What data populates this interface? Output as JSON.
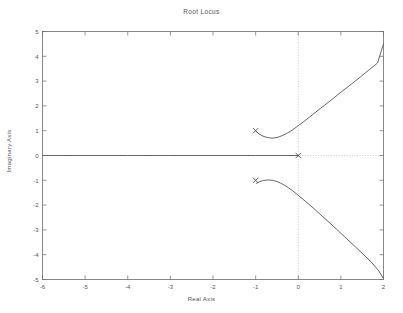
{
  "figure": {
    "title": "Root Locus",
    "background": "#ffffff",
    "axis_color": "#6b6b6b",
    "line_color": "#4a4a4a",
    "grid_color": "#b9b9b9"
  },
  "chart_data": {
    "type": "line",
    "title": "Root Locus",
    "xlabel": "Real Axis",
    "ylabel": "Imaginary Axis",
    "xlim": [
      -6,
      2
    ],
    "ylim": [
      -5,
      5
    ],
    "xticks": [
      -6,
      -5,
      -4,
      -3,
      -2,
      -1,
      0,
      1,
      2
    ],
    "xticklabels": [
      "-6",
      "-5",
      "-4",
      "-3",
      "-2",
      "-1",
      "0",
      "1",
      "2"
    ],
    "yticks": [
      -5,
      -4,
      -3,
      -2,
      -1,
      0,
      1,
      2,
      3,
      4,
      5
    ],
    "yticklabels": [
      "-5",
      "-4",
      "-3",
      "-2",
      "-1",
      "0",
      "1",
      "2",
      "3",
      "4",
      "5"
    ],
    "grid": false,
    "legend": null,
    "zero_lines": {
      "vertical_x": 0,
      "horizontal_y": 0,
      "style": "dotted"
    },
    "markers": [
      {
        "name": "open-loop-pole",
        "symbol": "x",
        "x": -1.0,
        "y": 1.0
      },
      {
        "name": "open-loop-pole",
        "symbol": "x",
        "x": -1.0,
        "y": -1.0
      },
      {
        "name": "open-loop-pole",
        "symbol": "x",
        "x": 0.0,
        "y": 0.0
      }
    ],
    "series": [
      {
        "name": "real-axis-branch",
        "points": [
          [
            -6.0,
            0.0
          ],
          [
            -5.0,
            0.0
          ],
          [
            -4.0,
            0.0
          ],
          [
            -3.0,
            0.0
          ],
          [
            -2.0,
            0.0
          ],
          [
            -1.0,
            0.0
          ],
          [
            -0.5,
            0.0
          ],
          [
            0.0,
            0.0
          ]
        ]
      },
      {
        "name": "upper-complex-branch",
        "points": [
          [
            -0.98,
            0.96
          ],
          [
            -0.92,
            0.87
          ],
          [
            -0.85,
            0.8
          ],
          [
            -0.78,
            0.75
          ],
          [
            -0.7,
            0.72
          ],
          [
            -0.62,
            0.7
          ],
          [
            -0.55,
            0.71
          ],
          [
            -0.47,
            0.74
          ],
          [
            -0.38,
            0.8
          ],
          [
            -0.28,
            0.88
          ],
          [
            -0.18,
            0.98
          ],
          [
            -0.08,
            1.1
          ],
          [
            0.02,
            1.23
          ],
          [
            0.14,
            1.38
          ],
          [
            0.28,
            1.57
          ],
          [
            0.44,
            1.79
          ],
          [
            0.62,
            2.03
          ],
          [
            0.82,
            2.3
          ],
          [
            1.02,
            2.58
          ],
          [
            1.24,
            2.87
          ],
          [
            1.46,
            3.17
          ],
          [
            1.68,
            3.48
          ],
          [
            1.86,
            3.73
          ],
          [
            2.0,
            4.5
          ]
        ]
      },
      {
        "name": "lower-complex-branch",
        "points": [
          [
            -0.98,
            -1.12
          ],
          [
            -0.9,
            -1.05
          ],
          [
            -0.82,
            -1.01
          ],
          [
            -0.74,
            -0.99
          ],
          [
            -0.66,
            -0.99
          ],
          [
            -0.58,
            -1.01
          ],
          [
            -0.5,
            -1.05
          ],
          [
            -0.42,
            -1.11
          ],
          [
            -0.33,
            -1.19
          ],
          [
            -0.24,
            -1.29
          ],
          [
            -0.14,
            -1.41
          ],
          [
            -0.04,
            -1.55
          ],
          [
            0.08,
            -1.72
          ],
          [
            0.22,
            -1.92
          ],
          [
            0.38,
            -2.16
          ],
          [
            0.56,
            -2.44
          ],
          [
            0.74,
            -2.72
          ],
          [
            0.94,
            -3.04
          ],
          [
            1.14,
            -3.36
          ],
          [
            1.34,
            -3.68
          ],
          [
            1.54,
            -4.01
          ],
          [
            1.72,
            -4.31
          ],
          [
            1.88,
            -4.63
          ],
          [
            2.0,
            -4.96
          ]
        ]
      }
    ]
  }
}
